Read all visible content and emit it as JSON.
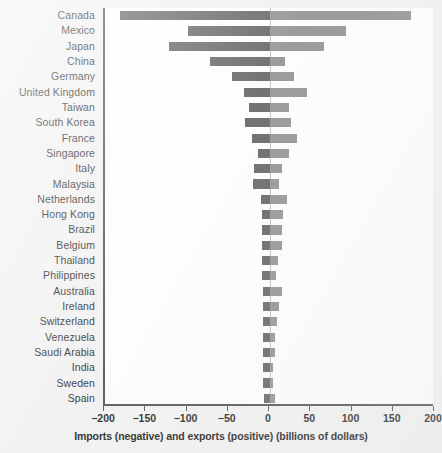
{
  "chart_data": {
    "type": "bar",
    "orientation": "horizontal",
    "title": "",
    "subtitle": "",
    "xlabel": "Imports (negative) and exports (positive) (billions of dollars)",
    "ylabel": "",
    "xlim": [
      -200,
      200
    ],
    "xticks": [
      -200,
      -150,
      -100,
      -50,
      0,
      50,
      100,
      150,
      200
    ],
    "xtick_labels": [
      "−200",
      "−150",
      "−100",
      "−50",
      "0",
      "50",
      "100",
      "150",
      "200"
    ],
    "grid": false,
    "legend": null,
    "colors": {
      "imports_bar": "#5c5c5c",
      "exports_bar": "#8d8d8d",
      "axis": "#4a4a4a",
      "zero_line": "#bfbfbf",
      "page_background": "#f2f2f2",
      "plot_background": "#ffffff",
      "text": "#1a1a1a"
    },
    "categories": [
      "Canada",
      "Mexico",
      "Japan",
      "China",
      "Germany",
      "United Kingdom",
      "Taiwan",
      "South Korea",
      "France",
      "Singapore",
      "Italy",
      "Malaysia",
      "Netherlands",
      "Hong Kong",
      "Brazil",
      "Belgium",
      "Thailand",
      "Philippines",
      "Australia",
      "Ireland",
      "Switzerland",
      "Venezuela",
      "Saudi Arabia",
      "India",
      "Sweden",
      "Spain"
    ],
    "series": [
      {
        "name": "Imports (negative)",
        "values": [
          -182,
          -99,
          -122,
          -73,
          -46,
          -32,
          -26,
          -30,
          -22,
          -15,
          -20,
          -21,
          -11,
          -10,
          -10,
          -10,
          -10,
          -10,
          -8,
          -9,
          -9,
          -9,
          -9,
          -9,
          -8,
          -7
        ]
      },
      {
        "name": "Exports (positive)",
        "values": [
          171,
          92,
          66,
          18,
          29,
          45,
          23,
          26,
          33,
          23,
          14,
          11,
          20,
          16,
          15,
          14,
          10,
          7,
          14,
          11,
          9,
          6,
          6,
          4,
          4,
          6
        ]
      }
    ]
  }
}
